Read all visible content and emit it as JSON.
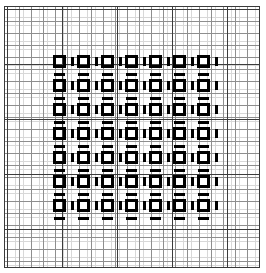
{
  "figure": {
    "kind": "pattern-grid",
    "canvas": {
      "width": 266,
      "height": 273,
      "background": "#ffffff"
    },
    "frame": {
      "x": 4,
      "y": 6,
      "width": 256,
      "height": 262,
      "border_color": "#3a3a3a",
      "border_width": 1
    }
  },
  "background_grid": {
    "description": "Graph-paper ruling beneath the motif",
    "minor": {
      "spacing_px": 8.0,
      "color": "#d8d8d8",
      "line_width": 1,
      "origin_x": 2,
      "origin_y": 2
    },
    "mid": {
      "spacing_px": 12.0,
      "color": "#8e8e8e",
      "line_width": 1,
      "origin_x": 2,
      "origin_y": 2
    },
    "major": {
      "spacing_px": 55.0,
      "color": "#3c3c3c",
      "line_width": 1,
      "origin_x": 2,
      "origin_y": 2
    }
  },
  "motif": {
    "description": "7x7 array of bold open squares, each with a short vertical dash to its right and a short horizontal dash below",
    "color": "#000000",
    "rows": 7,
    "columns": 7,
    "period_x": 24.0,
    "period_y": 24.0,
    "origin_x": 48,
    "origin_y": 48,
    "square": {
      "size_px": 13,
      "stroke_px": 3,
      "fill": "transparent"
    },
    "dash_right": {
      "offset_x": 18,
      "offset_y": 2,
      "width_px": 3,
      "height_px": 9
    },
    "dash_below": {
      "offset_x": 1,
      "offset_y": 18,
      "width_px": 11,
      "height_px": 3
    }
  },
  "colors": {
    "ink": "#000000",
    "grid_minor": "#d8d8d8",
    "grid_mid": "#8e8e8e",
    "grid_major": "#3c3c3c",
    "frame": "#3a3a3a",
    "paper": "#ffffff"
  }
}
